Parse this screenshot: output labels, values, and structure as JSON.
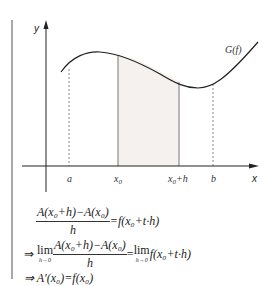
{
  "diagram": {
    "axes": {
      "x_label": "x",
      "y_label": "y"
    },
    "curve_label": "G(f)",
    "x_ticks": [
      {
        "id": "a",
        "label": "a",
        "style": "dashed"
      },
      {
        "id": "x0",
        "label": "x",
        "sub": "0",
        "style": "solid"
      },
      {
        "id": "x0h",
        "label": "x",
        "sub": "0",
        "suffix": "+h",
        "style": "solid"
      },
      {
        "id": "b",
        "label": "b",
        "style": "dashed"
      }
    ],
    "shaded_region": {
      "from": "x0",
      "to": "x0+h",
      "fill": "#f5f1ef"
    },
    "colors": {
      "line": "#222222",
      "shade": "#f5f1ef",
      "dashed": "#888888"
    }
  },
  "formulas": {
    "line1": {
      "numerator": "A(x₀+h)−A(x₀)",
      "denominator": "h",
      "rhs": "=f(x₀+t·h)"
    },
    "line2": {
      "implies": "⇒",
      "lim": "lim",
      "lim_under": "h→0",
      "numerator": "A(x₀+h)−A(x₀)",
      "denominator": "h",
      "eq": "=",
      "lim2": "lim",
      "lim2_under": "h→0",
      "rhs": "f(x₀+t·h)"
    },
    "line3": {
      "text": "⇒ A′(x₀)=f(x₀)"
    }
  }
}
